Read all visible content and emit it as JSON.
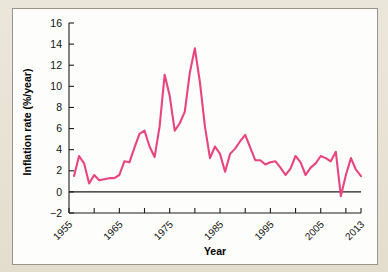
{
  "figure": {
    "background_color": "#e9e4d7",
    "panel_color": "#fdfdfb",
    "panel_border_color": "#9a948a"
  },
  "chart_data": {
    "type": "line",
    "title": "",
    "xlabel": "Year",
    "ylabel": "Inflation rate (%/year)",
    "xlim": [
      1955,
      2013
    ],
    "ylim": [
      -2,
      16
    ],
    "yticks": [
      -2,
      0,
      2,
      4,
      6,
      8,
      10,
      12,
      14,
      16
    ],
    "ytick_labels": [
      "−2",
      "0",
      "2",
      "4",
      "6",
      "8",
      "10",
      "12",
      "14",
      "16"
    ],
    "xticks": [
      1955,
      1960,
      1965,
      1970,
      1975,
      1980,
      1985,
      1990,
      1995,
      2000,
      2005,
      2010,
      2013
    ],
    "xtick_labels": [
      "1955",
      "",
      "1965",
      "",
      "1975",
      "",
      "1985",
      "",
      "1995",
      "",
      "2005",
      "",
      "2013"
    ],
    "grid": false,
    "legend": null,
    "line_color": "#e8447f",
    "line_width": 2.1,
    "zero_line": true,
    "series": [
      {
        "name": "US inflation rate",
        "x": [
          1956,
          1957,
          1958,
          1959,
          1960,
          1961,
          1962,
          1963,
          1964,
          1965,
          1966,
          1967,
          1968,
          1969,
          1970,
          1971,
          1972,
          1973,
          1974,
          1975,
          1976,
          1977,
          1978,
          1979,
          1980,
          1981,
          1982,
          1983,
          1984,
          1985,
          1986,
          1987,
          1988,
          1989,
          1990,
          1991,
          1992,
          1993,
          1994,
          1995,
          1996,
          1997,
          1998,
          1999,
          2000,
          2001,
          2002,
          2003,
          2004,
          2005,
          2006,
          2007,
          2008,
          2009,
          2010,
          2011,
          2012,
          2013
        ],
        "values": [
          1.5,
          3.4,
          2.7,
          0.8,
          1.6,
          1.1,
          1.2,
          1.3,
          1.3,
          1.6,
          2.9,
          2.8,
          4.2,
          5.5,
          5.8,
          4.3,
          3.3,
          6.2,
          11.1,
          9.1,
          5.8,
          6.5,
          7.6,
          11.3,
          13.6,
          10.4,
          6.2,
          3.2,
          4.3,
          3.6,
          1.9,
          3.6,
          4.1,
          4.8,
          5.4,
          4.2,
          3.0,
          3.0,
          2.6,
          2.8,
          2.9,
          2.3,
          1.6,
          2.2,
          3.4,
          2.8,
          1.6,
          2.3,
          2.7,
          3.4,
          3.2,
          2.9,
          3.8,
          -0.4,
          1.6,
          3.2,
          2.1,
          1.5
        ]
      }
    ]
  }
}
